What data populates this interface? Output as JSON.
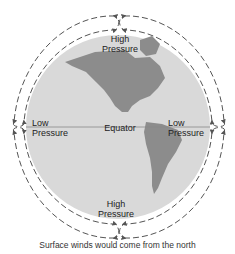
{
  "diagram": {
    "labels": {
      "north_high": [
        "High",
        "Pressure"
      ],
      "south_high": [
        "High",
        "Pressure"
      ],
      "west_low": [
        "Low",
        "Pressure"
      ],
      "east_low": [
        "Low",
        "Pressure"
      ],
      "equator": "Equator"
    },
    "caption": "Surface winds would come from the north",
    "colors": {
      "globe": "#d9d9d9",
      "land": "#8c8c8c",
      "arrows": "#555555",
      "equator_line": "#888888"
    }
  }
}
